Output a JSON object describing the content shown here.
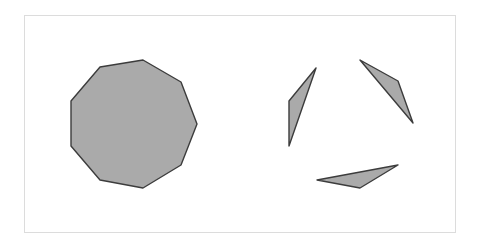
{
  "figure": {
    "width": 479,
    "height": 243,
    "frame": {
      "x": 24,
      "y": 15,
      "width": 431,
      "height": 217,
      "stroke": "#dcdcdc"
    },
    "fill_color": "#aaaaaa",
    "stroke_color": "#3c3c3c",
    "shapes": [
      {
        "name": "nonagon",
        "points": "100,67 143,60 181,82 197,124 181,165 143,188 100,180 71,146 71,101"
      },
      {
        "name": "triangle-left",
        "points": "316,68 289,101 289,146"
      },
      {
        "name": "triangle-right",
        "points": "360,60 398,81 413,123"
      },
      {
        "name": "triangle-bottom",
        "points": "317,180 398,165 360,188"
      }
    ]
  }
}
